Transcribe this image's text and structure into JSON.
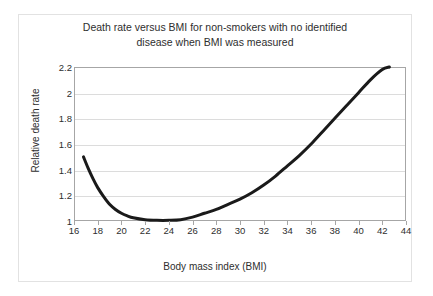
{
  "chart_data": {
    "type": "line",
    "title": "Death rate versus BMI for non-smokers with no identified\ndisease when BMI was measured",
    "xlabel": "Body mass index (BMI)",
    "ylabel": "Relative death rate",
    "xlim": [
      16,
      44
    ],
    "ylim": [
      1,
      2.2
    ],
    "grid": "horizontal",
    "legend": "none",
    "xticks": [
      "16",
      "18",
      "20",
      "22",
      "24",
      "26",
      "28",
      "30",
      "32",
      "34",
      "36",
      "38",
      "40",
      "42",
      "44"
    ],
    "xtick_values": [
      16,
      18,
      20,
      22,
      24,
      26,
      28,
      30,
      32,
      34,
      36,
      38,
      40,
      42,
      44
    ],
    "yticks": [
      "1",
      "1.2",
      "1.4",
      "1.6",
      "1.8",
      "2",
      "2.2"
    ],
    "ytick_values": [
      1,
      1.2,
      1.4,
      1.6,
      1.8,
      2,
      2.2
    ],
    "series": [
      {
        "name": "Relative death rate",
        "color": "#1a1a1a",
        "line_width": 3,
        "x": [
          16.8,
          17.2,
          17.6,
          18.0,
          18.5,
          19.0,
          19.5,
          20.0,
          20.5,
          21.0,
          22.0,
          23.0,
          24.0,
          25.0,
          26.0,
          27.0,
          28.0,
          29.0,
          30.0,
          31.0,
          32.0,
          33.0,
          34.0,
          35.0,
          36.0,
          37.0,
          38.0,
          39.0,
          40.0,
          41.0,
          42.0,
          42.6
        ],
        "y": [
          1.5,
          1.41,
          1.33,
          1.26,
          1.19,
          1.13,
          1.09,
          1.06,
          1.04,
          1.025,
          1.01,
          1.005,
          1.005,
          1.01,
          1.03,
          1.06,
          1.09,
          1.13,
          1.17,
          1.22,
          1.28,
          1.35,
          1.43,
          1.51,
          1.6,
          1.7,
          1.8,
          1.9,
          2.0,
          2.1,
          2.18,
          2.2
        ]
      }
    ]
  },
  "axes": {
    "plot_border_color": "#a6a6a6",
    "gridline_color": "#dcdcdc",
    "frame_color": "#e2e2e2"
  }
}
